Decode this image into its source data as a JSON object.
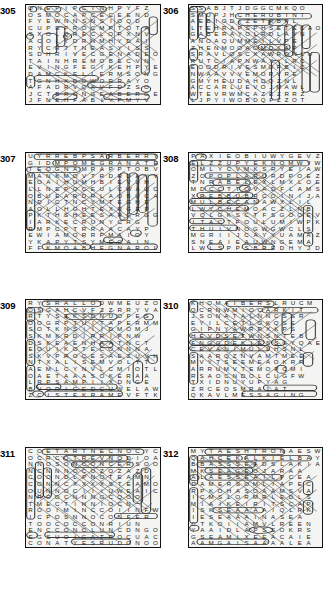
{
  "page": {
    "kind": "word-search-puzzle-sheet",
    "columns": 2,
    "rows": 4,
    "background_color": "#ffffff",
    "grid_fill_color": "#f4f4f2",
    "ink_color": "#1a1a1a",
    "mark_color": "#4a4a4a"
  },
  "puzzles": [
    {
      "number": "305",
      "cols": 16,
      "rows": 14,
      "letters": [
        "ONEPIPCTNHPYFZ",
        "OSMOCAPCECEEND",
        "FYEWNNSNSIOQD",
        "CUPEPROCMPTOTA",
        "SXOLQRECLOPXNV",
        "ACOLYDRNMHYDAI",
        "RYCRTTNEASYISS",
        "SDHRIVECGENADEO",
        "TAINHREMOBECVN",
        "EVINGFEGIKEHPYE",
        "DAMCKELLERMSONG",
        "TGNHXDOWORRAYO",
        "AFADRVQXVFDZSO",
        "JCTBRONGEABERGE",
        "JFNEHFABIYPMYV"
      ]
    },
    {
      "number": "306",
      "cols": 16,
      "rows": 14,
      "letters": [
        "SSABJTJDGGCMKQO",
        "SMUPJHCHERUBINI",
        "AEBIODIZETRBPL",
        "LTEHRAPSPHSETECAO",
        "GABERAYOLRDLAVN",
        "ANOAQUMMEILVPE",
        "ZHENMOOAOMDIAP",
        "SRAVLOSCXAWRONLU",
        "RUTCIAPNWAXILRC",
        "EOODRIVESMOPBIC",
        "NWAAVVVEMORVRE",
        "GMYHEUDAHDQZNL",
        "ACCARLUEVOJMAWL",
        "WTEVRWMCAZEZRRZ",
        "LJPYIWOBDQFZZOT"
      ]
    },
    {
      "number": "307",
      "cols": 16,
      "rows": 15,
      "letters": [
        "UYRREBPSARBERRY",
        "GIDMPOMEGRANATE",
        "TEOGNAMRAPPTOBV",
        "MANKMOVTRDRDAYV",
        "EOAIHUMHBIEVUH",
        "LLNEPOCEULCWAQC",
        "OBUEARDRLAOBUCA",
        "NDICTNCYMTEGHE",
        "AOLLHGHTEXRGEP",
        "PKTHSHEESARGRGG",
        "IARKECRUNYCRG",
        "RMPCPTRRAACAYP",
        "EWIAMORRPMAIOY",
        "YKAPYTSYMEGAIN",
        "FFKMOABHEGNAROL"
      ]
    },
    {
      "number": "308",
      "cols": 16,
      "rows": 15,
      "letters": [
        "PAXIEOBIUWYGEVZ",
        "ELZZUPYEKNOMWYW",
        "OMLYCVMKSRYEIAW",
        "ZOPOPLARURDPOEZ",
        "TNRABELEXLMXLOE",
        "MDCCTTOVADFLAMS",
        "XREBBUBRCOINIJA",
        "MULBECANAWXLIL",
        "LWYCHEMOACZLNB",
        "VQLGKSCTFSGOOEV",
        "ITACTFOULUMIWPK",
        "THUIVNOGWGWCLS",
        "MGRIIJCAYYUAMAZ",
        "SNEAIEAUWNGEMA",
        "LWLSPPSBREDHYJD"
      ]
    },
    {
      "number": "309",
      "cols": 16,
      "rows": 15,
      "letters": [
        "RYSRALLODWMEUZO",
        "OSGAHCVFZZRRYVA",
        "RTYSEKSDNUOPES",
        "OOGRPTUITAPERMM",
        "SOTKNSIIIDMOMJ",
        "SKMKRDIRRIPNW",
        "DSKEAENHAATNCT",
        "EOUIKOTECONNNA",
        "SKVPROCESAEZUVH",
        "NTXALISEMVOLTT",
        "AEMLCYNVLCMIOTL",
        "OAETAAASOKERAA",
        "LRPSAMPIIXDNGE",
        "BVORICEDCUWELAW",
        "ZCISTEKRAMEVFTK"
      ]
    },
    {
      "number": "310",
      "cols": 16,
      "rows": 15,
      "letters": [
        "KHOMAIBERSLRUCM",
        "QCRNWMIOCARKIT",
        "JSONATALNNCSSR",
        "EYILCETLOKQSE",
        "GIPNYAWRRXKPS",
        "HEVDSETWNSNTEB",
        "FNGGDEKIESSGYQAE",
        "CEVANIMULLHSNL",
        "SAARQZNVAMTMEE",
        "MVYTSEEMEAOKRR",
        "ARRUMVTEMOPCMI",
        "RSAOCNDOLCUGFW",
        "TXIDNUYUPYAG",
        "ZRCEOSMRAIAT",
        "QKAVLMESSAGING"
      ]
    },
    {
      "number": "311",
      "cols": 16,
      "rows": 15,
      "letters": [
        "COETARTNECNOCYC",
        "OCRCOTREVNODIOA",
        "NNOSONCONCERSOO",
        "NCNNNOCOZOZAZD",
        "COONDLPNOTEAMN",
        "CONNCXXXXSTEAMO",
        "OUNNOCIIIUWEAIC",
        "NROOCNNNGCQOO",
        "TMECTINNIOCN",
        "ROOIMINCCOIINFW",
        "ICPOSNNOCONFER",
        "TOOCOCCONRIUN",
        "ENCCONCLUNCDNGO",
        "EGSUOIGATROCUAC",
        "CONATYESRUDONOO"
      ]
    },
    {
      "number": "312",
      "cols": 16,
      "rows": 15,
      "letters": [
        "MYTAESHTRONAESW",
        "QAHCEKALKIELBAY",
        "BBASSSEADSLAKIA",
        "MKSEAGEOJARAA",
        "ALAESSEAILPCEA",
        "DAMERSOMLIAPEC",
        "RPKOHASOAAMSVA",
        "ICMSLORMRLEDLS",
        "MIAIKEIRITSCAP",
        "ISKSEAAAAIQLRK",
        "IESEAAAINASEA",
        "CTKOIIAMVLREEN",
        "YAAIDLAPSSOKRS",
        "GSEAMIXEEACAIE",
        "AAMGAISAAAALEA"
      ]
    }
  ]
}
